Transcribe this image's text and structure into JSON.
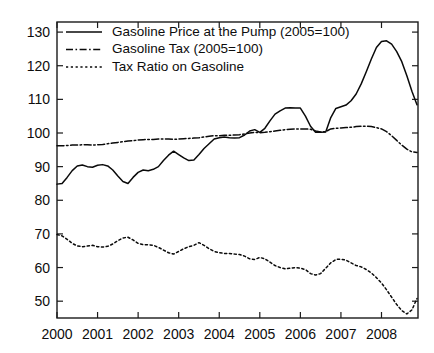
{
  "chart_data": {
    "type": "line",
    "title": "",
    "subtitle": "",
    "xlabel": "",
    "ylabel": "",
    "xlim": [
      2000.0,
      2008.9
    ],
    "ylim": [
      45,
      133
    ],
    "grid": false,
    "legend_position": "top-left",
    "x_ticks": [
      "2000",
      "2001",
      "2002",
      "2003",
      "2004",
      "2005",
      "2006",
      "2007",
      "2008"
    ],
    "x_tick_values": [
      2000,
      2001,
      2002,
      2003,
      2004,
      2005,
      2006,
      2007,
      2008
    ],
    "y_ticks": [
      "50",
      "60",
      "70",
      "80",
      "90",
      "100",
      "110",
      "120",
      "130"
    ],
    "y_tick_values": [
      50,
      60,
      70,
      80,
      90,
      100,
      110,
      120,
      130
    ],
    "x": [
      2000.0,
      2000.125,
      2000.25,
      2000.375,
      2000.5,
      2000.625,
      2000.75,
      2000.875,
      2001.0,
      2001.125,
      2001.25,
      2001.375,
      2001.5,
      2001.625,
      2001.75,
      2001.875,
      2002.0,
      2002.125,
      2002.25,
      2002.375,
      2002.5,
      2002.625,
      2002.75,
      2002.875,
      2003.0,
      2003.125,
      2003.25,
      2003.375,
      2003.5,
      2003.625,
      2003.75,
      2003.875,
      2004.0,
      2004.125,
      2004.25,
      2004.375,
      2004.5,
      2004.625,
      2004.75,
      2004.875,
      2005.0,
      2005.125,
      2005.25,
      2005.375,
      2005.5,
      2005.625,
      2005.75,
      2005.875,
      2006.0,
      2006.125,
      2006.25,
      2006.375,
      2006.5,
      2006.625,
      2006.75,
      2006.875,
      2007.0,
      2007.125,
      2007.25,
      2007.375,
      2007.5,
      2007.625,
      2007.75,
      2007.875,
      2008.0,
      2008.125,
      2008.25,
      2008.375,
      2008.5,
      2008.625,
      2008.75,
      2008.875
    ],
    "series": [
      {
        "name": "Gasoline Price at the Pump (2005=100)",
        "style": "solid",
        "values": [
          84.8,
          85.0,
          86.8,
          88.8,
          90.2,
          90.5,
          90.0,
          89.8,
          90.4,
          90.6,
          90.2,
          89.0,
          87.2,
          85.6,
          85.0,
          86.8,
          88.3,
          89.0,
          88.8,
          89.2,
          90.0,
          91.8,
          93.4,
          94.6,
          93.6,
          92.6,
          91.8,
          92.0,
          93.6,
          95.4,
          96.8,
          98.2,
          98.6,
          98.8,
          98.6,
          98.5,
          98.6,
          99.4,
          100.6,
          101.0,
          100.2,
          101.4,
          103.6,
          105.6,
          106.6,
          107.4,
          107.5,
          107.4,
          107.4,
          105.0,
          102.0,
          100.2,
          100.2,
          100.3,
          104.6,
          107.3,
          107.8,
          108.3,
          109.6,
          111.6,
          114.6,
          118.2,
          122.0,
          125.4,
          127.2,
          127.4,
          126.4,
          124.2,
          121.2,
          117.0,
          112.4,
          108.4
        ]
      },
      {
        "name": "Gasoline Tax (2005=100)",
        "style": "dash-dot",
        "values": [
          96.2,
          96.2,
          96.3,
          96.4,
          96.4,
          96.5,
          96.5,
          96.4,
          96.5,
          96.6,
          96.8,
          97.0,
          97.2,
          97.4,
          97.6,
          97.7,
          97.9,
          98.0,
          98.1,
          98.1,
          98.2,
          98.2,
          98.2,
          98.1,
          98.2,
          98.3,
          98.4,
          98.5,
          98.6,
          98.8,
          99.0,
          99.2,
          99.2,
          99.3,
          99.3,
          99.4,
          99.5,
          99.7,
          100.0,
          100.2,
          100.1,
          100.2,
          100.4,
          100.6,
          100.8,
          101.0,
          101.1,
          101.2,
          101.2,
          101.2,
          101.1,
          100.6,
          100.3,
          100.4,
          101.2,
          101.4,
          101.5,
          101.6,
          101.7,
          101.9,
          102.0,
          102.0,
          101.9,
          101.6,
          101.2,
          100.4,
          99.2,
          97.8,
          96.4,
          95.2,
          94.4,
          94.2
        ]
      },
      {
        "name": "Tax Ratio on Gasoline",
        "style": "dotted",
        "values": [
          69.8,
          69.4,
          68.4,
          67.2,
          66.4,
          66.2,
          66.4,
          66.6,
          66.2,
          66.1,
          66.3,
          67.0,
          68.0,
          68.8,
          69.0,
          68.2,
          67.2,
          66.8,
          66.8,
          66.6,
          66.0,
          65.2,
          64.4,
          64.0,
          64.8,
          65.6,
          66.2,
          66.6,
          67.4,
          66.6,
          65.6,
          64.8,
          64.4,
          64.2,
          64.2,
          64.0,
          63.9,
          63.4,
          62.6,
          62.4,
          63.0,
          62.6,
          61.6,
          60.6,
          60.0,
          59.6,
          59.8,
          60.0,
          59.8,
          59.4,
          58.2,
          57.8,
          58.2,
          59.8,
          61.4,
          62.4,
          62.5,
          62.2,
          61.4,
          60.6,
          60.2,
          59.4,
          58.4,
          57.0,
          55.4,
          53.4,
          51.2,
          49.0,
          47.2,
          46.2,
          47.4,
          50.8
        ]
      }
    ]
  }
}
